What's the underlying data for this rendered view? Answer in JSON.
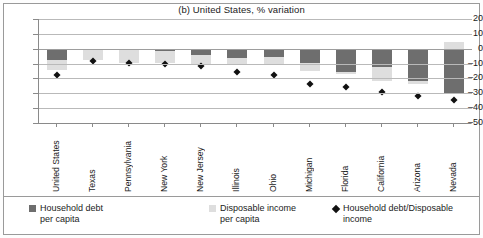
{
  "chart_data": {
    "type": "bar",
    "title": "(b) United States, % variation",
    "xlabel": "",
    "ylabel": "",
    "ylim": [
      -50,
      20
    ],
    "yticks": [
      20,
      10,
      0,
      -10,
      -20,
      -30,
      -40,
      -50
    ],
    "ytick_labels": [
      "20",
      "10",
      "0",
      "–10",
      "–20",
      "–30",
      "–40",
      "–50"
    ],
    "grid": true,
    "stacked": true,
    "legend_position": "bottom",
    "categories": [
      "United States",
      "Texas",
      "Pennsylvania",
      "New York",
      "New Jersey",
      "Illinois",
      "Ohio",
      "Michigan",
      "Florida",
      "California",
      "Arizona",
      "Nevada"
    ],
    "series": [
      {
        "name": "Household debt per capita",
        "color": "#6e6e6e",
        "values": [
          -7.5,
          -1.0,
          -0.8,
          -1.8,
          -4.0,
          -6.2,
          -5.5,
          -9.8,
          -15.5,
          -12.5,
          -22.0,
          -30.5
        ]
      },
      {
        "name": "Disposable income per capita",
        "color": "#dedede",
        "values": [
          -6.5,
          -6.8,
          -8.5,
          -7.8,
          -6.8,
          -4.8,
          -5.0,
          -5.2,
          -1.5,
          -9.0,
          -1.5,
          4.5
        ]
      },
      {
        "name": "Household debt/Disposable income",
        "type": "marker",
        "marker": "diamond",
        "color": "#111111",
        "values": [
          -18.0,
          -8.5,
          -9.5,
          -10.5,
          -11.5,
          -16.0,
          -17.5,
          -24.0,
          -26.0,
          -29.0,
          -31.5,
          -34.5
        ]
      }
    ],
    "legend": [
      {
        "label_line1": "Household debt",
        "label_line2": "per capita",
        "swatch": "debt"
      },
      {
        "label_line1": "Disposable income",
        "label_line2": "per capita",
        "swatch": "inc"
      },
      {
        "label_line1": "Household debt/Disposable",
        "label_line2": "income",
        "swatch": "ratio"
      }
    ]
  }
}
